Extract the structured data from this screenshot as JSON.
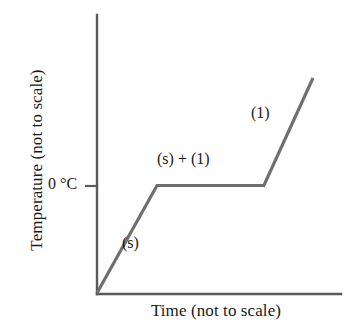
{
  "chart_data": {
    "type": "line",
    "title": "",
    "xlabel": "Time (not to scale)",
    "ylabel": "Temperature (not to scale)",
    "grid": false,
    "legend": "none",
    "axis_style": "open-L",
    "xlim": [
      0,
      100
    ],
    "ylim": [
      0,
      100
    ],
    "x_tick_labels": [],
    "y_tick_labels": [
      "0 °C"
    ],
    "y_ticks": [
      0
    ],
    "series": [
      {
        "name": "heating curve",
        "color": "#6f6f6f",
        "x": [
          0,
          24.7,
          68.7,
          88.9
        ],
        "y": [
          0,
          50.0,
          50.0,
          100.0
        ]
      }
    ],
    "segments": [
      {
        "name": "solid-warming",
        "label": "(s)",
        "from": [
          0,
          0
        ],
        "to": [
          24.7,
          50.0
        ]
      },
      {
        "name": "melting-plateau",
        "label": "(s) + (1)",
        "from": [
          24.7,
          50.0
        ],
        "to": [
          68.7,
          50.0
        ]
      },
      {
        "name": "liquid-warming",
        "label": "(1)",
        "from": [
          68.7,
          50.0
        ],
        "to": [
          88.9,
          100.0
        ]
      }
    ],
    "annotations": [
      {
        "name": "solid-phase-label",
        "text": "(s)"
      },
      {
        "name": "melting-phase-label",
        "text": "(s) + (1)"
      },
      {
        "name": "liquid-phase-label",
        "text": "(1)"
      }
    ],
    "melting_point_label": "0 °C"
  },
  "axes": {
    "y_title": "Temperature (not to scale)",
    "x_title": "Time (not to scale)",
    "y_tick_0c": "0 °C"
  },
  "labels": {
    "solid": "(s)",
    "solid_plus_liquid": "(s) + (1)",
    "liquid": "(1)"
  },
  "colors": {
    "background": "#ffffff",
    "axis": "#5a5a5a",
    "curve": "#6f6f6f",
    "text": "#1a1a1a"
  }
}
